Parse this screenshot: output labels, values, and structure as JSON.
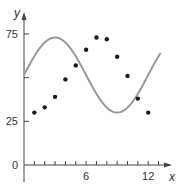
{
  "chart_data": {
    "type": "scatter",
    "title": "",
    "xlabel": "x",
    "ylabel": "y",
    "xlim": [
      0,
      13.5
    ],
    "ylim": [
      0,
      85
    ],
    "grid": false,
    "legend": "none",
    "x_ticks": [
      1,
      2,
      3,
      4,
      5,
      6,
      7,
      8,
      9,
      10,
      11,
      12,
      13
    ],
    "x_tick_labels": [
      {
        "value": 6,
        "label": "6"
      },
      {
        "value": 12,
        "label": "12"
      }
    ],
    "y_tick_labels": [
      {
        "value": 0,
        "label": "0"
      },
      {
        "value": 25,
        "label": "25"
      },
      {
        "value": 50,
        "label": ""
      },
      {
        "value": 75,
        "label": "75"
      }
    ],
    "series": [
      {
        "name": "data points",
        "kind": "scatter",
        "color": "#1a1a1a",
        "x": [
          1,
          2,
          3,
          4,
          5,
          6,
          7,
          8,
          9,
          10,
          11,
          12
        ],
        "y": [
          30,
          33,
          39,
          49,
          57,
          66,
          73,
          72,
          62,
          51,
          38,
          30
        ]
      },
      {
        "name": "sinusoidal fit",
        "kind": "line",
        "color": "#999999",
        "equation": "y = 51.5 + 21.5 sin(pi x / 6)",
        "x_range": [
          0,
          13.2
        ],
        "amplitude": 21.5,
        "offset": 51.5,
        "period": 12
      }
    ]
  }
}
